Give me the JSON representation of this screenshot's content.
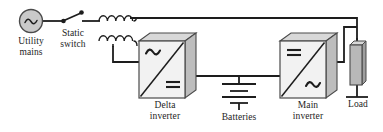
{
  "diagram": {
    "type": "circuit-schematic",
    "colors": {
      "wire": "#1d1d1d",
      "text": "#1d1d1d",
      "block_face": "#f2f2f2",
      "block_top": "#d8d8d8",
      "block_side": "#bdbdbd",
      "source_fill": "#c9c9c9",
      "load_fill": "#b8b8b8",
      "background": "#ffffff"
    },
    "components": [
      {
        "id": "utility-mains",
        "label": "Utility\nmains",
        "label_line1": "Utility",
        "label_line2": "mains",
        "symbol": "ac-source-icon",
        "symbol_meaning": "AC voltage source (circle with sine wave)"
      },
      {
        "id": "static-switch",
        "label": "Static\nswitch",
        "label_line1": "Static",
        "label_line2": "switch",
        "symbol": "switch-icon",
        "symbol_meaning": "Single-pole switch with two terminal dots"
      },
      {
        "id": "delta-transformer",
        "label": "",
        "symbol": "transformer-icon",
        "symbol_meaning": "Two stacked coil windings (delta transformer)"
      },
      {
        "id": "delta-inverter",
        "label": "Delta\ninverter",
        "label_line1": "Delta",
        "label_line2": "inverter",
        "symbol": "converter-block-icon",
        "symbol_top_left": "ac-sine-icon",
        "symbol_bottom_right": "dc-lines-icon",
        "symbol_meaning": "AC to DC converter block"
      },
      {
        "id": "batteries",
        "label": "Batteries",
        "label_line1": "Batteries",
        "symbol": "battery-icon",
        "symbol_meaning": "Battery cell stack (alternating long and short plates)"
      },
      {
        "id": "main-inverter",
        "label": "Main\ninverter",
        "label_line1": "Main",
        "label_line2": "inverter",
        "symbol": "converter-block-icon",
        "symbol_top_left": "dc-lines-icon",
        "symbol_bottom_right": "ac-sine-icon",
        "symbol_meaning": "DC to AC inverter block"
      },
      {
        "id": "load",
        "label": "Load",
        "label_line1": "Load",
        "symbol": "load-block-icon",
        "symbol_meaning": "Load represented as a shaded 3D rectangle"
      }
    ],
    "connections": [
      {
        "from": "utility-mains",
        "to": "static-switch",
        "kind": "ac-line"
      },
      {
        "from": "static-switch",
        "to": "delta-transformer",
        "kind": "ac-line"
      },
      {
        "from": "delta-transformer",
        "to": "load",
        "kind": "ac-bus"
      },
      {
        "from": "delta-transformer",
        "to": "delta-inverter",
        "kind": "ac-line"
      },
      {
        "from": "delta-inverter",
        "to": "batteries",
        "kind": "dc-bus"
      },
      {
        "from": "batteries",
        "to": "main-inverter",
        "kind": "dc-bus"
      },
      {
        "from": "main-inverter",
        "to": "load",
        "kind": "ac-output"
      }
    ]
  }
}
